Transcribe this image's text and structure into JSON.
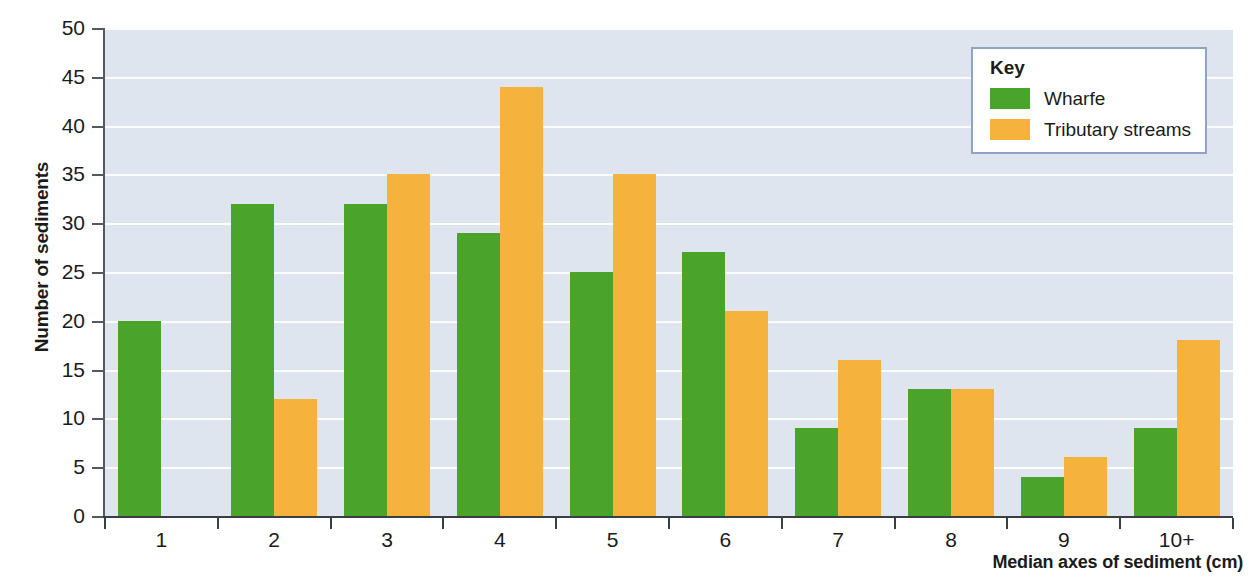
{
  "chart_data": {
    "type": "bar",
    "title": "",
    "xlabel": "Median axes of sediment (cm)",
    "ylabel": "Number of sediments",
    "categories": [
      "1",
      "2",
      "3",
      "4",
      "5",
      "6",
      "7",
      "8",
      "9",
      "10+"
    ],
    "ylim": [
      0,
      50
    ],
    "yticks": [
      0,
      5,
      10,
      15,
      20,
      25,
      30,
      35,
      40,
      45,
      50
    ],
    "grid": "horizontal",
    "legend_position": "top-right",
    "series": [
      {
        "name": "Wharfe",
        "color": "#4aa32b",
        "values": [
          20,
          32,
          32,
          29,
          25,
          27,
          9,
          13,
          4,
          9
        ]
      },
      {
        "name": "Tributary streams",
        "color": "#f5b23c",
        "values": [
          0,
          12,
          35,
          44,
          35,
          21,
          16,
          13,
          6,
          18
        ]
      }
    ]
  },
  "legend": {
    "title": "Key"
  },
  "colors": {
    "wharfe": "#4aa32b",
    "tributary": "#f5b23c",
    "plot_background": "#dfe5ee",
    "gridline": "#fafcfe",
    "legend_border": "#8fa3c4"
  }
}
